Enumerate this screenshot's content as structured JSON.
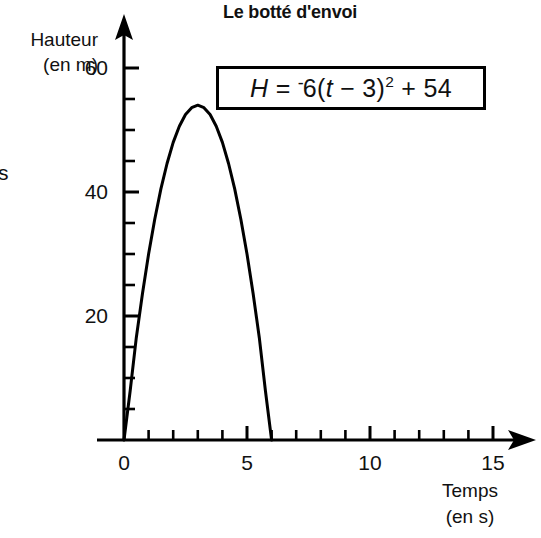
{
  "figure": {
    "title": "Le botté d'envoi",
    "stray_glyph": "s",
    "equation": {
      "lhs": "H",
      "equals": "=",
      "neg": "-",
      "coefficient": "6",
      "open_paren": "(",
      "variable": "t",
      "minus": "−",
      "shift": "3",
      "close_paren": ")",
      "exponent": "2",
      "plus": "+",
      "constant": "54",
      "full_text": "H = -6(t - 3)² + 54"
    }
  },
  "chart_data": {
    "type": "line",
    "title": "Le botté d'envoi",
    "xlabel_line1": "Temps",
    "xlabel_line2": "(en s)",
    "ylabel_line1": "Hauteur",
    "ylabel_line2": "(en m)",
    "equation": "H = -6(t - 3)^2 + 54",
    "grid": false,
    "legend": "none",
    "xlim": [
      0,
      16.7
    ],
    "ylim": [
      0,
      67
    ],
    "x_major_ticks": [
      0,
      5,
      10,
      15
    ],
    "x_major_tick_labels": [
      "0",
      "5",
      "10",
      "15"
    ],
    "x_minor_tick_step": 1,
    "y_major_ticks": [
      20,
      40,
      60
    ],
    "y_major_tick_labels": [
      "20",
      "40",
      "60"
    ],
    "y_minor_tick_step": 5,
    "vertex": {
      "t": 3,
      "H": 54
    },
    "roots": [
      0,
      6
    ],
    "series": [
      {
        "name": "H(t)",
        "color": "#000000",
        "points": [
          {
            "t": 0,
            "H": 0
          },
          {
            "t": 0.25,
            "H": 7.9
          },
          {
            "t": 0.5,
            "H": 16.5
          },
          {
            "t": 0.75,
            "H": 23.6
          },
          {
            "t": 1,
            "H": 30
          },
          {
            "t": 1.25,
            "H": 35.6
          },
          {
            "t": 1.5,
            "H": 40.5
          },
          {
            "t": 1.75,
            "H": 44.6
          },
          {
            "t": 2,
            "H": 48
          },
          {
            "t": 2.25,
            "H": 50.6
          },
          {
            "t": 2.5,
            "H": 52.5
          },
          {
            "t": 2.75,
            "H": 53.6
          },
          {
            "t": 3,
            "H": 54
          },
          {
            "t": 3.25,
            "H": 53.6
          },
          {
            "t": 3.5,
            "H": 52.5
          },
          {
            "t": 3.75,
            "H": 50.6
          },
          {
            "t": 4,
            "H": 48
          },
          {
            "t": 4.25,
            "H": 44.6
          },
          {
            "t": 4.5,
            "H": 40.5
          },
          {
            "t": 4.75,
            "H": 35.6
          },
          {
            "t": 5,
            "H": 30
          },
          {
            "t": 5.25,
            "H": 23.6
          },
          {
            "t": 5.5,
            "H": 16.5
          },
          {
            "t": 5.75,
            "H": 7.9
          },
          {
            "t": 6,
            "H": 0
          }
        ]
      }
    ]
  }
}
